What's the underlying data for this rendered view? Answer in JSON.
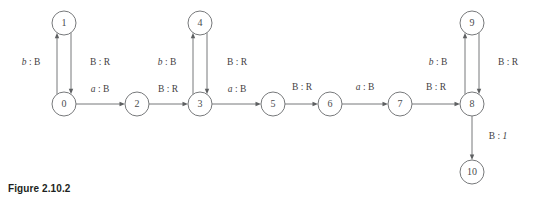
{
  "figure": {
    "caption": "Figure 2.10.2",
    "colors": {
      "background": "#ffffff",
      "stroke": "#77797b",
      "node_fill": "#ffffff",
      "label_text": "#3f4143",
      "caption_text": "#1d1f21"
    }
  },
  "chart_data": {
    "type": "diagram",
    "diagram_kind": "state-transition-diagram",
    "title": "Figure 2.10.2",
    "node_radius": 12,
    "nodes": [
      {
        "id": "0",
        "label": "0",
        "x": 64,
        "y": 104
      },
      {
        "id": "1",
        "label": "1",
        "x": 64,
        "y": 23
      },
      {
        "id": "2",
        "label": "2",
        "x": 137,
        "y": 104
      },
      {
        "id": "3",
        "label": "3",
        "x": 200,
        "y": 104
      },
      {
        "id": "4",
        "label": "4",
        "x": 200,
        "y": 23
      },
      {
        "id": "5",
        "label": "5",
        "x": 273,
        "y": 104
      },
      {
        "id": "6",
        "label": "6",
        "x": 330,
        "y": 104
      },
      {
        "id": "7",
        "label": "7",
        "x": 400,
        "y": 104
      },
      {
        "id": "8",
        "label": "8",
        "x": 472,
        "y": 104
      },
      {
        "id": "9",
        "label": "9",
        "x": 472,
        "y": 23
      },
      {
        "id": "10",
        "label": "10",
        "x": 472,
        "y": 172
      }
    ],
    "edges": [
      {
        "id": "e0-1",
        "from": "0",
        "to": "1",
        "read": "b",
        "write": "B",
        "label": "b : B",
        "label_x": 31,
        "label_y": 63
      },
      {
        "id": "e1-0",
        "from": "1",
        "to": "0",
        "read": "B",
        "write": "R",
        "label": "B : R",
        "label_x": 100,
        "label_y": 63
      },
      {
        "id": "e0-2",
        "from": "0",
        "to": "2",
        "read": "a",
        "write": "B",
        "label": "a : B",
        "label_x": 100,
        "label_y": 90
      },
      {
        "id": "e2-3",
        "from": "2",
        "to": "3",
        "read": "B",
        "write": "R",
        "label": "B : R",
        "label_x": 168,
        "label_y": 90
      },
      {
        "id": "e3-4",
        "from": "3",
        "to": "4",
        "read": "b",
        "write": "B",
        "label": "b : B",
        "label_x": 167,
        "label_y": 63
      },
      {
        "id": "e4-3",
        "from": "4",
        "to": "3",
        "read": "B",
        "write": "R",
        "label": "B : R",
        "label_x": 237,
        "label_y": 63
      },
      {
        "id": "e3-5",
        "from": "3",
        "to": "5",
        "read": "a",
        "write": "B",
        "label": "a : B",
        "label_x": 237,
        "label_y": 90
      },
      {
        "id": "e5-6",
        "from": "5",
        "to": "6",
        "read": "B",
        "write": "R",
        "label": "B : R",
        "label_x": 302,
        "label_y": 88
      },
      {
        "id": "e6-7",
        "from": "6",
        "to": "7",
        "read": "a",
        "write": "B",
        "label": "a : B",
        "label_x": 365,
        "label_y": 88
      },
      {
        "id": "e7-8",
        "from": "7",
        "to": "8",
        "read": "B",
        "write": "R",
        "label": "B : R",
        "label_x": 436,
        "label_y": 88
      },
      {
        "id": "e8-9",
        "from": "8",
        "to": "9",
        "read": "b",
        "write": "B",
        "label": "b : B",
        "label_x": 438,
        "label_y": 63
      },
      {
        "id": "e9-8",
        "from": "9",
        "to": "8",
        "read": "B",
        "write": "R",
        "label": "B : R",
        "label_x": 508,
        "label_y": 63
      },
      {
        "id": "e8-10",
        "from": "8",
        "to": "10",
        "read": "B",
        "write": "1",
        "label": "B : 1",
        "label_x": 498,
        "label_y": 137
      }
    ]
  }
}
